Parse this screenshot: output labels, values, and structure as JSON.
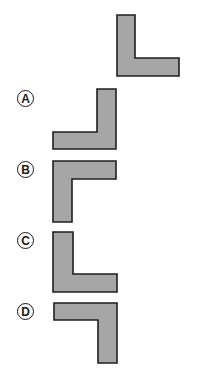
{
  "figure": {
    "colors": {
      "fill": "#a6a6a6",
      "stroke": "#1e1e1e",
      "background": "#ffffff"
    },
    "reference": {
      "name": "reference-shape",
      "path": "M117 15 L135 15 L135 58 L179 58 L179 76 L117 76 Z"
    },
    "options": [
      {
        "label": "A",
        "label_pos": [
          17,
          90
        ],
        "path": "M97 89 L116 89 L116 149 L53 149 L53 132 L97 132 Z"
      },
      {
        "label": "B",
        "label_pos": [
          17,
          160
        ],
        "path": "M53 161 L116 161 L116 179 L72 179 L72 222 L53 222 Z"
      },
      {
        "label": "C",
        "label_pos": [
          17,
          232
        ],
        "path": "M53 232 L73 232 L73 274 L117 274 L117 292 L53 292 Z"
      },
      {
        "label": "D",
        "label_pos": [
          17,
          303
        ],
        "path": "M54 303 L117 303 L117 363 L98 363 L98 320 L54 320 Z"
      }
    ]
  }
}
